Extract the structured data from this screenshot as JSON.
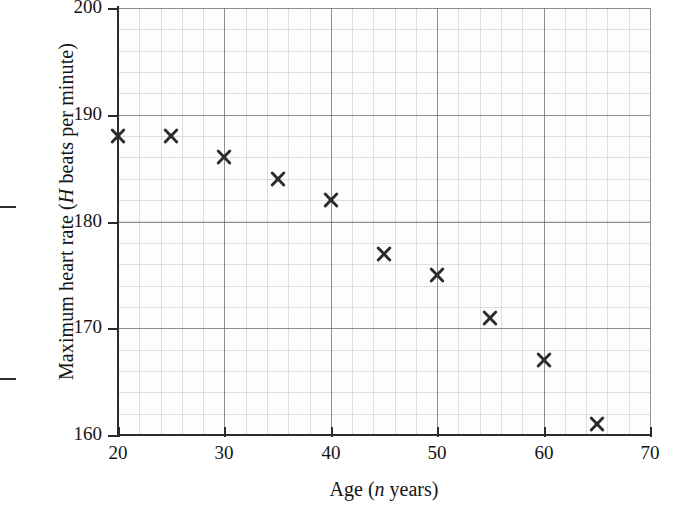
{
  "chart_data": {
    "type": "scatter",
    "title": "",
    "xlabel": "Age (n years)",
    "ylabel": "Maximum heart rate (H beats per minute)",
    "xlabel_parts": {
      "pre": "Age (",
      "italic": "n",
      "post": " years)"
    },
    "ylabel_parts": {
      "pre": "Maximum heart rate (",
      "italic": "H",
      "post": " beats per minute)"
    },
    "x_variable": "n",
    "y_variable": "H",
    "xlim": [
      20,
      70
    ],
    "ylim": [
      160,
      200
    ],
    "x_ticks": [
      20,
      30,
      40,
      50,
      60,
      70
    ],
    "y_ticks": [
      160,
      170,
      180,
      190,
      200
    ],
    "x_tick_labels": [
      "20",
      "30",
      "40",
      "50",
      "60",
      "70"
    ],
    "y_tick_labels": [
      "160",
      "170",
      "180",
      "190",
      "200"
    ],
    "x_minor_step": 2,
    "y_minor_step": 2,
    "grid": true,
    "grid_style": "graph-paper",
    "legend": "none",
    "marker": "x-cross",
    "marker_color": "#2b2b2b",
    "x": [
      20,
      25,
      30,
      35,
      40,
      45,
      50,
      55,
      60,
      65
    ],
    "values": [
      188,
      188,
      186,
      184,
      182,
      177,
      175,
      171,
      167,
      161
    ],
    "points": [
      {
        "n": 20,
        "H": 188
      },
      {
        "n": 25,
        "H": 188
      },
      {
        "n": 30,
        "H": 186
      },
      {
        "n": 35,
        "H": 184
      },
      {
        "n": 40,
        "H": 182
      },
      {
        "n": 45,
        "H": 177
      },
      {
        "n": 50,
        "H": 175
      },
      {
        "n": 55,
        "H": 171
      },
      {
        "n": 60,
        "H": 167
      },
      {
        "n": 65,
        "H": 161
      }
    ]
  }
}
